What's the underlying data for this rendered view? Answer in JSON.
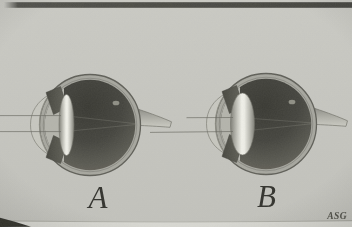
{
  "figure": {
    "panels": [
      {
        "label": "A"
      },
      {
        "label": "B"
      }
    ],
    "signature": "ASG"
  },
  "colors": {
    "background": "#c7c7c1",
    "top_band": "#4b4b45",
    "bottom_strip": "#d8d8d2",
    "sclera": "#a7a79f",
    "front_chamber": "#b4b4ac",
    "vitreous_dark": "#3a3a34",
    "lens_highlight": "#f1f1ea",
    "optic_nerve": "#bdbdb5",
    "label_ink": "#32322d",
    "signature_ink": "#4c4c45"
  }
}
